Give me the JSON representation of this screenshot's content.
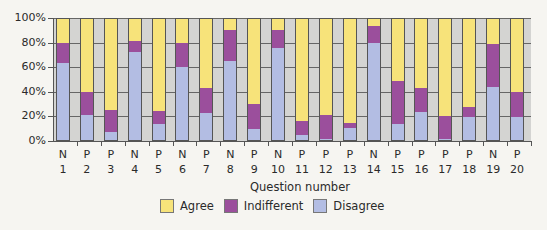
{
  "chart_data": {
    "type": "bar",
    "stacked": true,
    "percent": true,
    "title": "",
    "xlabel": "Question number",
    "ylabel": "",
    "ylim": [
      0,
      100
    ],
    "yticks": [
      "0%",
      "20%",
      "40%",
      "60%",
      "80%",
      "100%"
    ],
    "grid": true,
    "legend_position": "bottom",
    "categories": [
      "1",
      "2",
      "3",
      "4",
      "5",
      "6",
      "7",
      "8",
      "9",
      "10",
      "11",
      "12",
      "13",
      "14",
      "15",
      "16",
      "17",
      "18",
      "19",
      "20"
    ],
    "category_types": [
      "N",
      "P",
      "P",
      "N",
      "P",
      "N",
      "P",
      "N",
      "P",
      "N",
      "P",
      "P",
      "P",
      "N",
      "P",
      "P",
      "P",
      "P",
      "N",
      "P"
    ],
    "series": [
      {
        "name": "Disagree",
        "color": "#b3bde3",
        "values": [
          64,
          21,
          7,
          73,
          13,
          60,
          22,
          65,
          9,
          76,
          4,
          1,
          10,
          80,
          13,
          23,
          1,
          19,
          44,
          19
        ]
      },
      {
        "name": "Indifferent",
        "color": "#9b4f9c",
        "values": [
          16,
          19,
          18,
          9,
          11,
          20,
          21,
          26,
          21,
          15,
          12,
          20,
          4,
          14,
          36,
          20,
          19,
          8,
          35,
          21
        ]
      },
      {
        "name": "Agree",
        "color": "#f7e37a",
        "values": [
          20,
          60,
          75,
          18,
          76,
          20,
          57,
          9,
          70,
          9,
          84,
          79,
          86,
          6,
          51,
          57,
          80,
          73,
          21,
          60
        ]
      }
    ]
  },
  "legend": {
    "items": [
      {
        "label": "Agree",
        "color": "#f7e37a"
      },
      {
        "label": "Indifferent",
        "color": "#9b4f9c"
      },
      {
        "label": "Disagree",
        "color": "#b3bde3"
      }
    ]
  },
  "colors": {
    "plot_bg": "#d4d4d2",
    "page_bg": "#f6f5f1"
  }
}
